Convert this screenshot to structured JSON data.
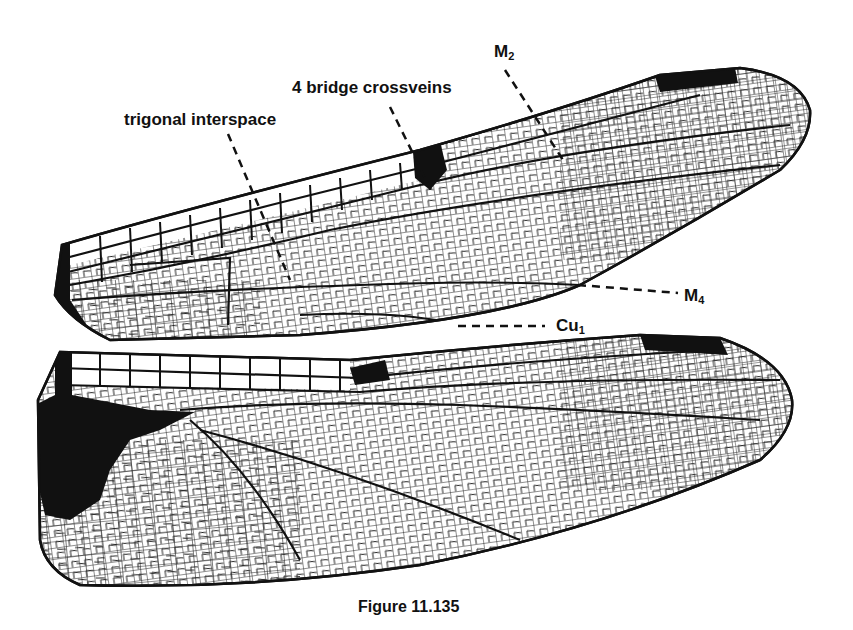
{
  "figure": {
    "caption": "Figure 11.135"
  },
  "labels": {
    "trigonal_interspace": "trigonal interspace",
    "bridge_crossveins": "4 bridge crossveins",
    "m2": {
      "base": "M",
      "sub": "2"
    },
    "m4": {
      "base": "M",
      "sub": "4"
    },
    "cu1": {
      "base": "Cu",
      "sub": "1"
    }
  },
  "colors": {
    "ink": "#111111",
    "background": "#ffffff"
  }
}
